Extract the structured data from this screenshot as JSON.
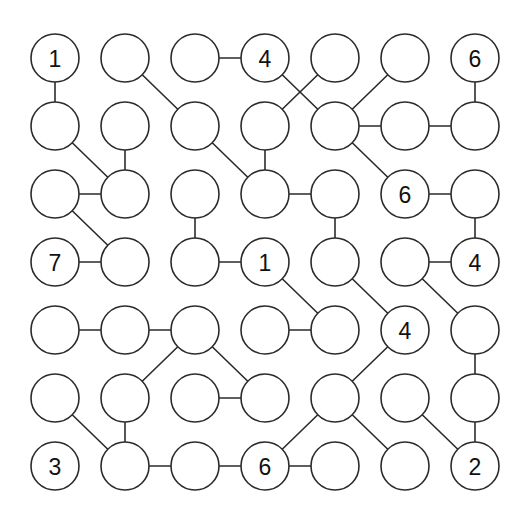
{
  "diagram": {
    "type": "node-link-grid-graph",
    "grid": {
      "rows": 7,
      "cols": 7
    },
    "geometry": {
      "width": 531,
      "height": 521,
      "origin_x": 55,
      "origin_y": 58,
      "col_spacing": 70,
      "row_spacing": 68,
      "node_radius": 24
    },
    "colors": {
      "background": "#ffffff",
      "stroke": "#2b2b2b",
      "node_fill": "#ffffff",
      "label": "#111111"
    },
    "nodes": [
      {
        "id": "r0c0",
        "row": 0,
        "col": 0,
        "label": "1"
      },
      {
        "id": "r0c1",
        "row": 0,
        "col": 1,
        "label": ""
      },
      {
        "id": "r0c2",
        "row": 0,
        "col": 2,
        "label": ""
      },
      {
        "id": "r0c3",
        "row": 0,
        "col": 3,
        "label": "4"
      },
      {
        "id": "r0c4",
        "row": 0,
        "col": 4,
        "label": ""
      },
      {
        "id": "r0c5",
        "row": 0,
        "col": 5,
        "label": ""
      },
      {
        "id": "r0c6",
        "row": 0,
        "col": 6,
        "label": "6"
      },
      {
        "id": "r1c0",
        "row": 1,
        "col": 0,
        "label": ""
      },
      {
        "id": "r1c1",
        "row": 1,
        "col": 1,
        "label": ""
      },
      {
        "id": "r1c2",
        "row": 1,
        "col": 2,
        "label": ""
      },
      {
        "id": "r1c3",
        "row": 1,
        "col": 3,
        "label": ""
      },
      {
        "id": "r1c4",
        "row": 1,
        "col": 4,
        "label": ""
      },
      {
        "id": "r1c5",
        "row": 1,
        "col": 5,
        "label": ""
      },
      {
        "id": "r1c6",
        "row": 1,
        "col": 6,
        "label": ""
      },
      {
        "id": "r2c0",
        "row": 2,
        "col": 0,
        "label": ""
      },
      {
        "id": "r2c1",
        "row": 2,
        "col": 1,
        "label": ""
      },
      {
        "id": "r2c2",
        "row": 2,
        "col": 2,
        "label": ""
      },
      {
        "id": "r2c3",
        "row": 2,
        "col": 3,
        "label": ""
      },
      {
        "id": "r2c4",
        "row": 2,
        "col": 4,
        "label": ""
      },
      {
        "id": "r2c5",
        "row": 2,
        "col": 5,
        "label": "6"
      },
      {
        "id": "r2c6",
        "row": 2,
        "col": 6,
        "label": ""
      },
      {
        "id": "r3c0",
        "row": 3,
        "col": 0,
        "label": "7"
      },
      {
        "id": "r3c1",
        "row": 3,
        "col": 1,
        "label": ""
      },
      {
        "id": "r3c2",
        "row": 3,
        "col": 2,
        "label": ""
      },
      {
        "id": "r3c3",
        "row": 3,
        "col": 3,
        "label": "1"
      },
      {
        "id": "r3c4",
        "row": 3,
        "col": 4,
        "label": ""
      },
      {
        "id": "r3c5",
        "row": 3,
        "col": 5,
        "label": ""
      },
      {
        "id": "r3c6",
        "row": 3,
        "col": 6,
        "label": "4"
      },
      {
        "id": "r4c0",
        "row": 4,
        "col": 0,
        "label": ""
      },
      {
        "id": "r4c1",
        "row": 4,
        "col": 1,
        "label": ""
      },
      {
        "id": "r4c2",
        "row": 4,
        "col": 2,
        "label": ""
      },
      {
        "id": "r4c3",
        "row": 4,
        "col": 3,
        "label": ""
      },
      {
        "id": "r4c4",
        "row": 4,
        "col": 4,
        "label": ""
      },
      {
        "id": "r4c5",
        "row": 4,
        "col": 5,
        "label": "4"
      },
      {
        "id": "r4c6",
        "row": 4,
        "col": 6,
        "label": ""
      },
      {
        "id": "r5c0",
        "row": 5,
        "col": 0,
        "label": ""
      },
      {
        "id": "r5c1",
        "row": 5,
        "col": 1,
        "label": ""
      },
      {
        "id": "r5c2",
        "row": 5,
        "col": 2,
        "label": ""
      },
      {
        "id": "r5c3",
        "row": 5,
        "col": 3,
        "label": ""
      },
      {
        "id": "r5c4",
        "row": 5,
        "col": 4,
        "label": ""
      },
      {
        "id": "r5c5",
        "row": 5,
        "col": 5,
        "label": ""
      },
      {
        "id": "r5c6",
        "row": 5,
        "col": 6,
        "label": ""
      },
      {
        "id": "r6c0",
        "row": 6,
        "col": 0,
        "label": "3"
      },
      {
        "id": "r6c1",
        "row": 6,
        "col": 1,
        "label": ""
      },
      {
        "id": "r6c2",
        "row": 6,
        "col": 2,
        "label": ""
      },
      {
        "id": "r6c3",
        "row": 6,
        "col": 3,
        "label": "6"
      },
      {
        "id": "r6c4",
        "row": 6,
        "col": 4,
        "label": ""
      },
      {
        "id": "r6c5",
        "row": 6,
        "col": 5,
        "label": ""
      },
      {
        "id": "r6c6",
        "row": 6,
        "col": 6,
        "label": "2"
      }
    ],
    "edges": [
      {
        "from": "r0c0",
        "to": "r1c0"
      },
      {
        "from": "r0c1",
        "to": "r1c2"
      },
      {
        "from": "r0c2",
        "to": "r0c3"
      },
      {
        "from": "r0c3",
        "to": "r1c4"
      },
      {
        "from": "r0c4",
        "to": "r1c3"
      },
      {
        "from": "r0c5",
        "to": "r1c4"
      },
      {
        "from": "r0c6",
        "to": "r1c6"
      },
      {
        "from": "r1c0",
        "to": "r2c1"
      },
      {
        "from": "r1c1",
        "to": "r2c1"
      },
      {
        "from": "r1c2",
        "to": "r2c3"
      },
      {
        "from": "r1c3",
        "to": "r2c3"
      },
      {
        "from": "r1c4",
        "to": "r1c5"
      },
      {
        "from": "r1c4",
        "to": "r2c5"
      },
      {
        "from": "r1c5",
        "to": "r1c6"
      },
      {
        "from": "r2c0",
        "to": "r2c1"
      },
      {
        "from": "r2c0",
        "to": "r3c1"
      },
      {
        "from": "r2c2",
        "to": "r3c2"
      },
      {
        "from": "r2c3",
        "to": "r2c4"
      },
      {
        "from": "r2c4",
        "to": "r3c4"
      },
      {
        "from": "r2c5",
        "to": "r2c6"
      },
      {
        "from": "r2c6",
        "to": "r3c6"
      },
      {
        "from": "r3c0",
        "to": "r3c1"
      },
      {
        "from": "r3c2",
        "to": "r3c3"
      },
      {
        "from": "r3c3",
        "to": "r4c4"
      },
      {
        "from": "r3c4",
        "to": "r4c5"
      },
      {
        "from": "r3c5",
        "to": "r3c6"
      },
      {
        "from": "r3c5",
        "to": "r4c6"
      },
      {
        "from": "r4c0",
        "to": "r4c1"
      },
      {
        "from": "r4c1",
        "to": "r4c2"
      },
      {
        "from": "r4c2",
        "to": "r5c1"
      },
      {
        "from": "r4c2",
        "to": "r5c3"
      },
      {
        "from": "r4c3",
        "to": "r4c4"
      },
      {
        "from": "r4c5",
        "to": "r5c4"
      },
      {
        "from": "r4c6",
        "to": "r5c6"
      },
      {
        "from": "r5c0",
        "to": "r6c1"
      },
      {
        "from": "r5c1",
        "to": "r6c1"
      },
      {
        "from": "r5c2",
        "to": "r5c3"
      },
      {
        "from": "r5c4",
        "to": "r6c3"
      },
      {
        "from": "r5c4",
        "to": "r6c5"
      },
      {
        "from": "r5c5",
        "to": "r6c6"
      },
      {
        "from": "r5c6",
        "to": "r6c6"
      },
      {
        "from": "r6c1",
        "to": "r6c2"
      },
      {
        "from": "r6c2",
        "to": "r6c3"
      },
      {
        "from": "r6c3",
        "to": "r6c4"
      }
    ]
  }
}
